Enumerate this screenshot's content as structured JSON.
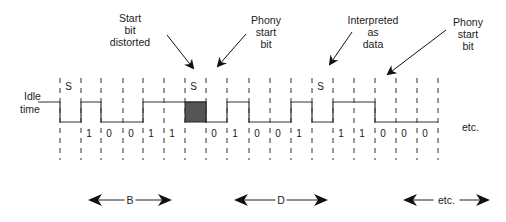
{
  "diagram": {
    "title_free": true,
    "idle_label": [
      "Idle",
      "time"
    ],
    "trailing_label": "etc.",
    "annotations": [
      {
        "id": "start-bit-distorted",
        "lines": [
          "Start",
          "bit",
          "distorted"
        ],
        "x": 130,
        "y": 22
      },
      {
        "id": "phony-start-bit-1",
        "lines": [
          "Phony",
          "start",
          "bit"
        ],
        "x": 266,
        "y": 24
      },
      {
        "id": "interpreted-as-data",
        "lines": [
          "Interpreted",
          "as",
          "data"
        ],
        "x": 373,
        "y": 24
      },
      {
        "id": "phony-start-bit-2",
        "lines": [
          "Phony",
          "start",
          "bit"
        ],
        "x": 468,
        "y": 26
      }
    ],
    "bit_cells": [
      {
        "label": "S",
        "row": "top"
      },
      {
        "label": "1",
        "row": "bottom"
      },
      {
        "label": "0",
        "row": "bottom"
      },
      {
        "label": "0",
        "row": "bottom"
      },
      {
        "label": "1",
        "row": "bottom"
      },
      {
        "label": "1",
        "row": "bottom"
      },
      {
        "label": "S",
        "row": "top"
      },
      {
        "label": "0",
        "row": "bottom"
      },
      {
        "label": "1",
        "row": "bottom"
      },
      {
        "label": "0",
        "row": "bottom"
      },
      {
        "label": "0",
        "row": "bottom"
      },
      {
        "label": "1",
        "row": "bottom"
      },
      {
        "label": "S",
        "row": "top"
      },
      {
        "label": "1",
        "row": "bottom"
      },
      {
        "label": "1",
        "row": "bottom"
      },
      {
        "label": "0",
        "row": "bottom"
      },
      {
        "label": "0",
        "row": "bottom"
      },
      {
        "label": "0",
        "row": "bottom"
      }
    ],
    "spans": [
      {
        "label": "B",
        "x1": 88,
        "x2": 172
      },
      {
        "label": "D",
        "x1": 234,
        "x2": 328
      },
      {
        "label": "etc.",
        "x1": 403,
        "x2": 490
      }
    ],
    "colors": {
      "line": "#333333",
      "distorted_fill": "#555555"
    }
  }
}
